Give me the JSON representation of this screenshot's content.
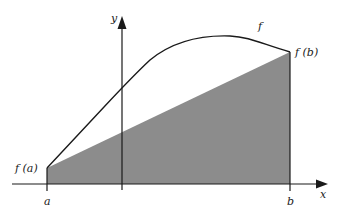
{
  "diagram": {
    "axes": {
      "x_label": "x",
      "y_label": "y"
    },
    "labels": {
      "curve": "f",
      "f_a": "f (a)",
      "f_b": "f (b)",
      "a": "a",
      "b": "b"
    },
    "colors": {
      "shaded_region": "#8c8c8c",
      "lines": "#1a1a1a",
      "background": "#ffffff"
    }
  }
}
